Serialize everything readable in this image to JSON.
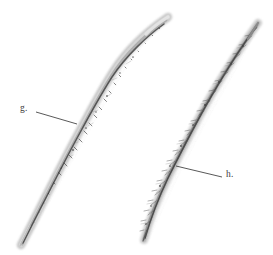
{
  "plate": {
    "width": 273,
    "height": 255,
    "background_color": "#ffffff",
    "ink_color": "#4a4a4a",
    "leader_color": "#3a3a3a",
    "label_color": "#3b3b3b",
    "specimen_count": 2,
    "illustration_type": "grayscale photographic plate of two elongate worm-like specimens"
  },
  "labels": [
    {
      "id": "g",
      "text": "g.",
      "x": 20,
      "y": 104,
      "target": "left-specimen"
    },
    {
      "id": "h",
      "text": "h.",
      "x": 226,
      "y": 170,
      "target": "right-specimen"
    }
  ],
  "leader_lines": [
    {
      "id": "leader-g",
      "from_x": 36,
      "from_y": 112,
      "to_x": 77,
      "to_y": 124,
      "label": "g."
    },
    {
      "id": "leader-h",
      "from_x": 176,
      "from_y": 166,
      "to_x": 222,
      "to_y": 177,
      "label": "h."
    }
  ],
  "specimens": [
    {
      "id": "left-specimen",
      "label": "g.",
      "description": "sigmoid curved smooth-bodied worm with dark internal axial line",
      "head_x": 168,
      "head_y": 16,
      "tail_x": 20,
      "tail_y": 246,
      "texture": "smooth"
    },
    {
      "id": "right-specimen",
      "label": "h.",
      "description": "nearly straight bristly worm with dense lateral setae",
      "head_x": 258,
      "head_y": 22,
      "tail_x": 143,
      "tail_y": 241,
      "texture": "setose"
    }
  ]
}
